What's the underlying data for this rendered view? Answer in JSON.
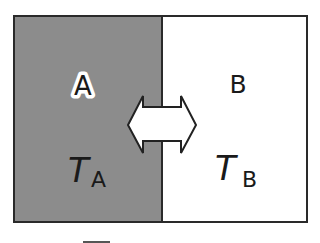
{
  "diagram": {
    "type": "two-system thermal contact",
    "colors": {
      "system_a_fill": "#8c8c8c",
      "system_b_fill": "#ffffff",
      "border": "#2a2a2a",
      "arrow_fill": "#ffffff"
    },
    "system_a": {
      "label": "A",
      "temperature_symbol": "T",
      "temperature_subscript": "A"
    },
    "system_b": {
      "label": "B",
      "temperature_symbol": "T",
      "temperature_subscript": "B"
    },
    "exchange_arrow": {
      "direction": "bidirectional",
      "description": "heat exchange between A and B"
    }
  }
}
